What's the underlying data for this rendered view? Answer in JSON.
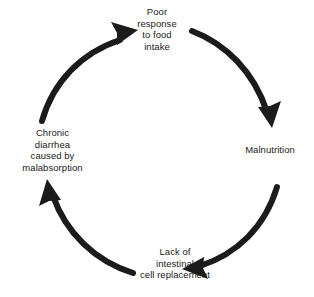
{
  "diagram": {
    "type": "cycle",
    "direction": "clockwise",
    "background_color": "#ffffff",
    "arrow_color": "#1b1b1b",
    "text_color": "#1b1b1b",
    "nodes": [
      {
        "id": "poor-response",
        "position": "top",
        "lines": [
          "Poor",
          "response",
          "to food",
          "intake"
        ]
      },
      {
        "id": "malnutrition",
        "position": "right",
        "lines": [
          "Malnutrition"
        ]
      },
      {
        "id": "lack-of-replacement",
        "position": "bottom",
        "lines": [
          "Lack of",
          "intestinal",
          "cell replacement"
        ]
      },
      {
        "id": "chronic-diarrhea",
        "position": "left",
        "lines": [
          "Chronic",
          "diarrhea",
          "caused by",
          "malabsorption"
        ]
      }
    ],
    "arrows": [
      {
        "id": "arrow-top-to-right",
        "from": "poor-response",
        "to": "malnutrition"
      },
      {
        "id": "arrow-right-to-bottom",
        "from": "malnutrition",
        "to": "lack-of-replacement"
      },
      {
        "id": "arrow-bottom-to-left",
        "from": "lack-of-replacement",
        "to": "chronic-diarrhea"
      },
      {
        "id": "arrow-left-to-top",
        "from": "chronic-diarrhea",
        "to": "poor-response"
      }
    ]
  }
}
